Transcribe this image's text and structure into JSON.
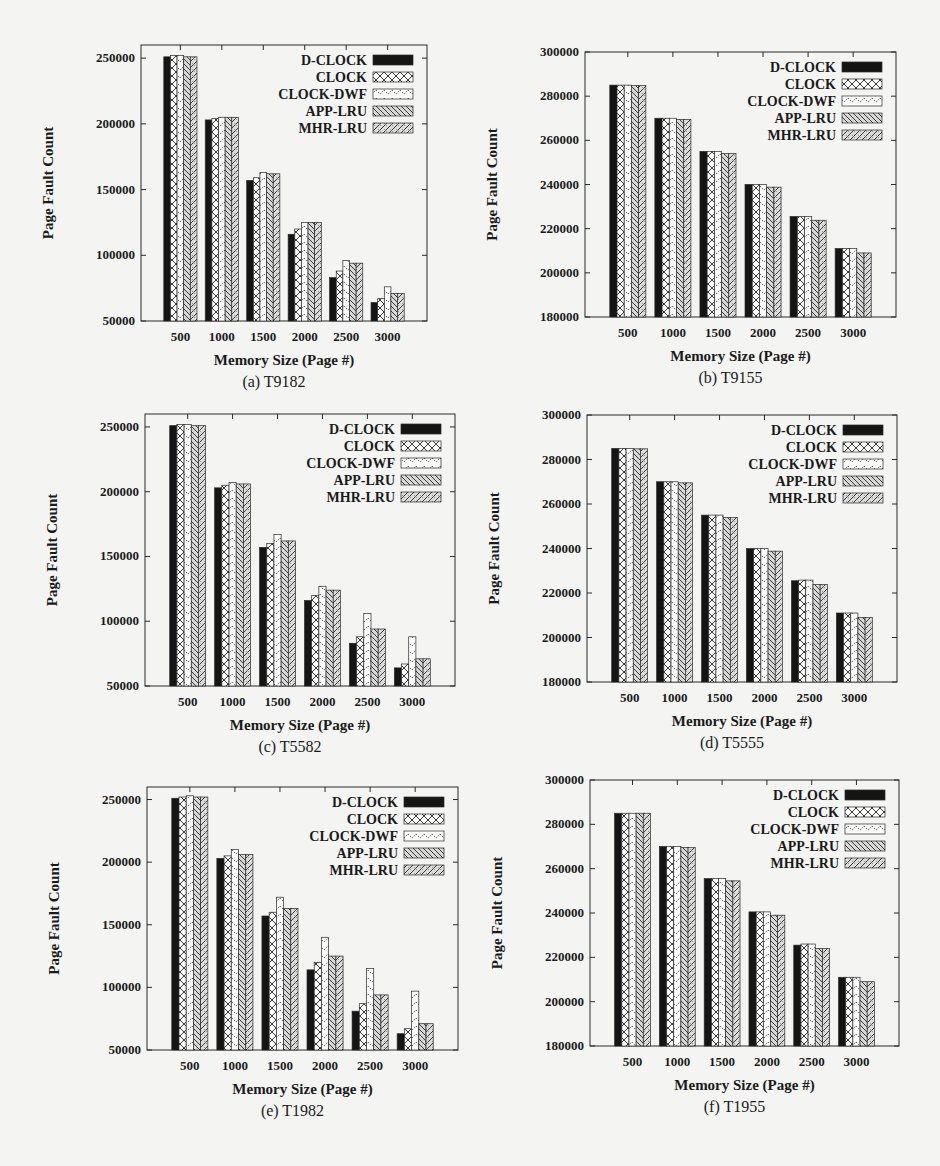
{
  "figure": {
    "legend_entries": [
      "D-CLOCK",
      "CLOCK",
      "CLOCK-DWF",
      "APP-LRU",
      "MHR-LRU"
    ],
    "xlabel": "Memory Size (Page #)",
    "ylabel": "Page Fault Count"
  },
  "chart_data": [
    {
      "id": "a",
      "type": "bar",
      "caption": "(a) T9182",
      "title": "T9182",
      "xlabel": "Memory Size (Page #)",
      "ylabel": "Page Fault Count",
      "categories": [
        "500",
        "1000",
        "1500",
        "2000",
        "2500",
        "3000"
      ],
      "ylim": [
        50000,
        260000
      ],
      "yticks": [
        50000,
        100000,
        150000,
        200000,
        250000
      ],
      "grid": false,
      "legend_position": "upper right",
      "series": [
        {
          "name": "D-CLOCK",
          "values": [
            251000,
            203000,
            157000,
            116000,
            83000,
            64000
          ]
        },
        {
          "name": "CLOCK",
          "values": [
            252000,
            204000,
            159000,
            120000,
            88000,
            67000
          ]
        },
        {
          "name": "CLOCK-DWF",
          "values": [
            252000,
            205000,
            163000,
            125000,
            96000,
            76000
          ]
        },
        {
          "name": "APP-LRU",
          "values": [
            251000,
            205000,
            162000,
            125000,
            94000,
            71000
          ]
        },
        {
          "name": "MHR-LRU",
          "values": [
            251000,
            205000,
            162000,
            125000,
            94000,
            71000
          ]
        }
      ]
    },
    {
      "id": "b",
      "type": "bar",
      "caption": "(b) T9155",
      "title": "T9155",
      "xlabel": "Memory Size (Page #)",
      "ylabel": "Page Fault Count",
      "categories": [
        "500",
        "1000",
        "1500",
        "2000",
        "2500",
        "3000"
      ],
      "ylim": [
        180000,
        300000
      ],
      "yticks": [
        180000,
        200000,
        220000,
        240000,
        260000,
        280000,
        300000
      ],
      "grid": false,
      "legend_position": "upper right",
      "series": [
        {
          "name": "D-CLOCK",
          "values": [
            285000,
            270000,
            255000,
            240000,
            225500,
            211000
          ]
        },
        {
          "name": "CLOCK",
          "values": [
            285000,
            270000,
            255000,
            240000,
            225500,
            211000
          ]
        },
        {
          "name": "CLOCK-DWF",
          "values": [
            285000,
            270000,
            255000,
            240000,
            225500,
            211000
          ]
        },
        {
          "name": "APP-LRU",
          "values": [
            284800,
            269500,
            254000,
            238800,
            223800,
            209000
          ]
        },
        {
          "name": "MHR-LRU",
          "values": [
            284800,
            269500,
            254000,
            238800,
            223800,
            209000
          ]
        }
      ]
    },
    {
      "id": "c",
      "type": "bar",
      "caption": "(c) T5582",
      "title": "T5582",
      "xlabel": "Memory Size (Page #)",
      "ylabel": "Page Fault Count",
      "categories": [
        "500",
        "1000",
        "1500",
        "2000",
        "2500",
        "3000"
      ],
      "ylim": [
        50000,
        260000
      ],
      "yticks": [
        50000,
        100000,
        150000,
        200000,
        250000
      ],
      "grid": false,
      "legend_position": "upper right",
      "series": [
        {
          "name": "D-CLOCK",
          "values": [
            251000,
            203000,
            157000,
            116000,
            83000,
            64000
          ]
        },
        {
          "name": "CLOCK",
          "values": [
            252000,
            205000,
            160000,
            120000,
            88000,
            67000
          ]
        },
        {
          "name": "CLOCK-DWF",
          "values": [
            252000,
            207000,
            167000,
            127000,
            106000,
            88000
          ]
        },
        {
          "name": "APP-LRU",
          "values": [
            251000,
            206000,
            162000,
            124000,
            94000,
            71000
          ]
        },
        {
          "name": "MHR-LRU",
          "values": [
            251000,
            206000,
            162000,
            124000,
            94000,
            71000
          ]
        }
      ]
    },
    {
      "id": "d",
      "type": "bar",
      "caption": "(d) T5555",
      "title": "T5555",
      "xlabel": "Memory Size (Page #)",
      "ylabel": "Page Fault Count",
      "categories": [
        "500",
        "1000",
        "1500",
        "2000",
        "2500",
        "3000"
      ],
      "ylim": [
        180000,
        300000
      ],
      "yticks": [
        180000,
        200000,
        220000,
        240000,
        260000,
        280000,
        300000
      ],
      "grid": false,
      "legend_position": "upper right",
      "series": [
        {
          "name": "D-CLOCK",
          "values": [
            285000,
            270000,
            255000,
            240000,
            225500,
            211000
          ]
        },
        {
          "name": "CLOCK",
          "values": [
            285000,
            270000,
            255000,
            240000,
            225800,
            211000
          ]
        },
        {
          "name": "CLOCK-DWF",
          "values": [
            285000,
            270000,
            255000,
            240000,
            225800,
            211000
          ]
        },
        {
          "name": "APP-LRU",
          "values": [
            284800,
            269500,
            254000,
            238800,
            223800,
            209000
          ]
        },
        {
          "name": "MHR-LRU",
          "values": [
            284800,
            269500,
            254000,
            238800,
            223800,
            209000
          ]
        }
      ]
    },
    {
      "id": "e",
      "type": "bar",
      "caption": "(e) T1982",
      "title": "T1982",
      "xlabel": "Memory Size (Page #)",
      "ylabel": "Page Fault Count",
      "categories": [
        "500",
        "1000",
        "1500",
        "2000",
        "2500",
        "3000"
      ],
      "ylim": [
        50000,
        260000
      ],
      "yticks": [
        50000,
        100000,
        150000,
        200000,
        250000
      ],
      "grid": false,
      "legend_position": "upper right",
      "series": [
        {
          "name": "D-CLOCK",
          "values": [
            251000,
            203000,
            157000,
            114000,
            81000,
            63000
          ]
        },
        {
          "name": "CLOCK",
          "values": [
            252000,
            205000,
            160000,
            120000,
            87000,
            67000
          ]
        },
        {
          "name": "CLOCK-DWF",
          "values": [
            253000,
            210000,
            172000,
            140000,
            115000,
            97000
          ]
        },
        {
          "name": "APP-LRU",
          "values": [
            252000,
            206000,
            163000,
            125000,
            94000,
            71000
          ]
        },
        {
          "name": "MHR-LRU",
          "values": [
            252000,
            206000,
            163000,
            125000,
            94000,
            71000
          ]
        }
      ]
    },
    {
      "id": "f",
      "type": "bar",
      "caption": "(f) T1955",
      "title": "T1955",
      "xlabel": "Memory Size (Page #)",
      "ylabel": "Page Fault Count",
      "categories": [
        "500",
        "1000",
        "1500",
        "2000",
        "2500",
        "3000"
      ],
      "ylim": [
        180000,
        300000
      ],
      "yticks": [
        180000,
        200000,
        220000,
        240000,
        260000,
        280000,
        300000
      ],
      "grid": false,
      "legend_position": "upper right",
      "series": [
        {
          "name": "D-CLOCK",
          "values": [
            285000,
            270000,
            255500,
            240500,
            225500,
            211000
          ]
        },
        {
          "name": "CLOCK",
          "values": [
            285000,
            270000,
            255500,
            240500,
            226000,
            211000
          ]
        },
        {
          "name": "CLOCK-DWF",
          "values": [
            285000,
            270000,
            255500,
            240500,
            226000,
            211000
          ]
        },
        {
          "name": "APP-LRU",
          "values": [
            285000,
            269500,
            254500,
            239000,
            224000,
            209000
          ]
        },
        {
          "name": "MHR-LRU",
          "values": [
            285000,
            269500,
            254500,
            239000,
            224000,
            209000
          ]
        }
      ]
    }
  ],
  "layout": {
    "panels": [
      {
        "id": "a",
        "x": 0,
        "y": 40,
        "plot": {
          "left": 141,
          "top": 45,
          "right": 427,
          "bottom": 321
        }
      },
      {
        "id": "b",
        "x": 470,
        "y": 40,
        "plot": {
          "left": 585,
          "top": 52,
          "right": 896,
          "bottom": 317
        }
      },
      {
        "id": "c",
        "x": 0,
        "y": 400,
        "plot": {
          "left": 145,
          "top": 414,
          "right": 455,
          "bottom": 686
        }
      },
      {
        "id": "d",
        "x": 470,
        "y": 400,
        "plot": {
          "left": 587,
          "top": 415,
          "right": 897,
          "bottom": 682
        }
      },
      {
        "id": "e",
        "x": 0,
        "y": 760,
        "plot": {
          "left": 147,
          "top": 787,
          "right": 458,
          "bottom": 1050
        }
      },
      {
        "id": "f",
        "x": 470,
        "y": 760,
        "plot": {
          "left": 590,
          "top": 780,
          "right": 899,
          "bottom": 1046
        }
      }
    ]
  },
  "colors": {
    "d_clock": "#151515",
    "frame": "#2a2a2a",
    "pattern_stroke": "#3a3a3a",
    "background": "#f4f4f2"
  }
}
